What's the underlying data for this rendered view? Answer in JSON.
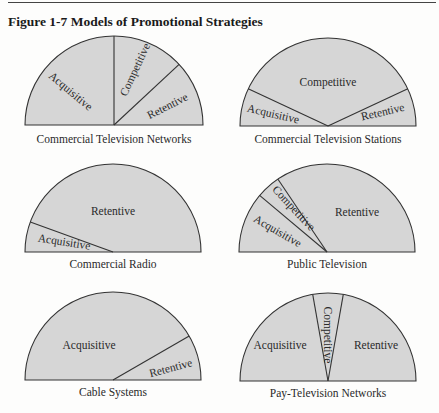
{
  "figure": {
    "rule": true,
    "title": "Figure 1-7 Models of Promotional Strategies"
  },
  "colors": {
    "background": "#fdfdfc",
    "segment_fill": "#d6d6d6",
    "stroke": "#333333",
    "text": "#2a2a2a"
  },
  "chart_data": {
    "type": "pie",
    "subtype": "semicircle-diagrams",
    "title": "Figure 1-7 Models of Promotional Strategies",
    "note": "Angles in degrees measured counter-clockwise from right baseline (0°) to left baseline (180°); segment size = angular span.",
    "diagrams": [
      {
        "caption": "Commercial Television Networks",
        "segments": [
          {
            "label": "Acquisitive",
            "start": 90,
            "end": 180,
            "share_pct": 50
          },
          {
            "label": "Competitive",
            "start": 43,
            "end": 90,
            "share_pct": 26
          },
          {
            "label": "Retentive",
            "start": 0,
            "end": 43,
            "share_pct": 24
          }
        ]
      },
      {
        "caption": "Commercial Television Stations",
        "segments": [
          {
            "label": "Acquisitive",
            "start": 155,
            "end": 180,
            "share_pct": 14
          },
          {
            "label": "Competitive",
            "start": 25,
            "end": 155,
            "share_pct": 72
          },
          {
            "label": "Retentive",
            "start": 0,
            "end": 25,
            "share_pct": 14
          }
        ]
      },
      {
        "caption": "Commercial Radio",
        "segments": [
          {
            "label": "Acquisitive",
            "start": 160,
            "end": 180,
            "share_pct": 11
          },
          {
            "label": "Retentive",
            "start": 0,
            "end": 160,
            "share_pct": 89
          }
        ]
      },
      {
        "caption": "Public Television",
        "segments": [
          {
            "label": "Acquisitive",
            "start": 140,
            "end": 180,
            "share_pct": 22
          },
          {
            "label": "Competitive",
            "start": 124,
            "end": 140,
            "share_pct": 9
          },
          {
            "label": "Retentive",
            "start": 0,
            "end": 124,
            "share_pct": 69
          }
        ]
      },
      {
        "caption": "Cable Systems",
        "segments": [
          {
            "label": "Acquisitive",
            "start": 30,
            "end": 180,
            "share_pct": 83
          },
          {
            "label": "Retentive",
            "start": 0,
            "end": 30,
            "share_pct": 17
          }
        ]
      },
      {
        "caption": "Pay-Television Networks",
        "segments": [
          {
            "label": "Acquisitive",
            "start": 100,
            "end": 180,
            "share_pct": 44
          },
          {
            "label": "Competitive",
            "start": 80,
            "end": 100,
            "share_pct": 11
          },
          {
            "label": "Retentive",
            "start": 0,
            "end": 80,
            "share_pct": 45
          }
        ]
      }
    ]
  },
  "diagrams": [
    {
      "caption": "Commercial Television Networks",
      "cx": 114,
      "cy": 125,
      "r": 89,
      "dividers": [
        90,
        43
      ],
      "labels": [
        {
          "text": "Acquisitive",
          "x": 70,
          "y": 92,
          "rot": 40
        },
        {
          "text": "Competitive",
          "x": 136,
          "y": 70,
          "rot": -65
        },
        {
          "text": "Retentive",
          "x": 168,
          "y": 107,
          "rot": -27
        }
      ],
      "caption_y": 140
    },
    {
      "caption": "Commercial Television Stations",
      "cx": 328,
      "cy": 126,
      "r": 88,
      "dividers": [
        155,
        25
      ],
      "labels": [
        {
          "text": "Competitive",
          "x": 328,
          "y": 83,
          "rot": 0
        },
        {
          "text": "Acquisitive",
          "x": 273,
          "y": 115,
          "rot": 13
        },
        {
          "text": "Retentive",
          "x": 383,
          "y": 113,
          "rot": -13
        }
      ],
      "caption_y": 140
    },
    {
      "caption": "Commercial Radio",
      "cx": 113,
      "cy": 252,
      "r": 88,
      "dividers": [
        160
      ],
      "labels": [
        {
          "text": "Retentive",
          "x": 113,
          "y": 212,
          "rot": 0
        },
        {
          "text": "Acquisitive",
          "x": 64,
          "y": 243,
          "rot": 9
        }
      ],
      "caption_y": 265
    },
    {
      "caption": "Public Television",
      "cx": 327,
      "cy": 252,
      "r": 88,
      "dividers": [
        140,
        124
      ],
      "labels": [
        {
          "text": "Retentive",
          "x": 357,
          "y": 213,
          "rot": 0
        },
        {
          "text": "Competitive",
          "x": 293,
          "y": 209,
          "rot": 47
        },
        {
          "text": "Acquisitive",
          "x": 277,
          "y": 232,
          "rot": 30
        }
      ],
      "caption_y": 265
    },
    {
      "caption": "Cable Systems",
      "cx": 113,
      "cy": 380,
      "r": 88,
      "dividers": [
        30
      ],
      "labels": [
        {
          "text": "Acquisitive",
          "x": 89,
          "y": 346,
          "rot": 0
        },
        {
          "text": "Retentive",
          "x": 171,
          "y": 369,
          "rot": -15
        }
      ],
      "caption_y": 393
    },
    {
      "caption": "Pay-Television Networks",
      "cx": 328,
      "cy": 381,
      "r": 88,
      "dividers": [
        100,
        80
      ],
      "labels": [
        {
          "text": "Acquisitive",
          "x": 280,
          "y": 346,
          "rot": 0
        },
        {
          "text": "Competitive",
          "x": 327,
          "y": 335,
          "rot": 90
        },
        {
          "text": "Retentive",
          "x": 376,
          "y": 346,
          "rot": 0
        }
      ],
      "caption_y": 394
    }
  ]
}
